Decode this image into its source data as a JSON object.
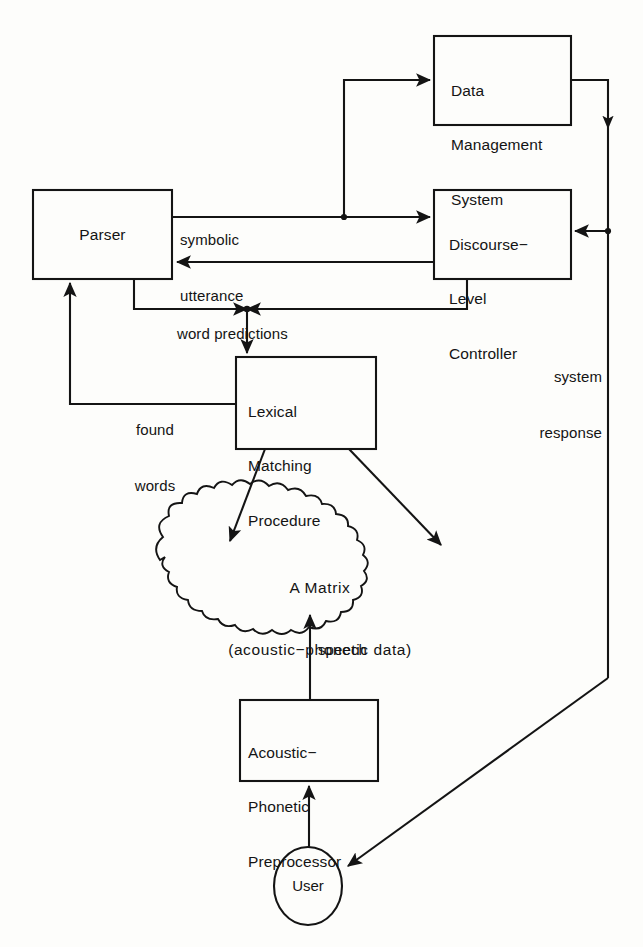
{
  "diagram": {
    "background_color": "#fdfdfb",
    "stroke_color": "#141414",
    "text_color": "#141414",
    "nodes": {
      "data_management_system": {
        "shape": "rectangle",
        "lines": [
          "Data",
          "Management",
          "System"
        ],
        "line1": "Data",
        "line2": "Management",
        "line3": "System"
      },
      "parser": {
        "shape": "rectangle",
        "label": "Parser"
      },
      "discourse_level_controller": {
        "shape": "rectangle",
        "lines": [
          "Discourse−",
          "Level",
          "Controller"
        ],
        "line1": "Discourse−",
        "line2": "Level",
        "line3": "Controller"
      },
      "lexical_matching_procedure": {
        "shape": "rectangle",
        "lines": [
          "Lexical",
          "Matching",
          "Procedure"
        ],
        "line1": "Lexical",
        "line2": "Matching",
        "line3": "Procedure"
      },
      "a_matrix": {
        "shape": "cloud",
        "line1": "A Matrix",
        "line2": "(acoustic−phonetic data)"
      },
      "acoustic_phonetic_preprocessor": {
        "shape": "rectangle",
        "lines": [
          "Acoustic−",
          "Phonetic",
          "Preprocessor"
        ],
        "line1": "Acoustic−",
        "line2": "Phonetic",
        "line3": "Preprocessor"
      },
      "user": {
        "shape": "ellipse",
        "label": "User"
      }
    },
    "edge_labels": {
      "symbolic_utterance_line1": "symbolic",
      "symbolic_utterance_line2": "utterance",
      "word_predictions": "word predictions",
      "found_words_line1": "found",
      "found_words_line2": "words",
      "system_response_line1": "system",
      "system_response_line2": "response",
      "speech": "speech"
    },
    "edges": [
      {
        "from": "parser",
        "to": "discourse_level_controller",
        "label": "symbolic utterance"
      },
      {
        "from": "parser",
        "to": "data_management_system",
        "label": "symbolic utterance"
      },
      {
        "from": "data_management_system",
        "to": "discourse_level_controller",
        "label": ""
      },
      {
        "from": "discourse_level_controller",
        "to": "parser",
        "label": ""
      },
      {
        "from": "parser",
        "to": "lexical_matching_procedure",
        "label": "word predictions"
      },
      {
        "from": "discourse_level_controller",
        "to": "lexical_matching_procedure",
        "label": "word predictions"
      },
      {
        "from": "lexical_matching_procedure",
        "to": "parser",
        "label": "found words"
      },
      {
        "from": "lexical_matching_procedure",
        "to": "a_matrix",
        "label": ""
      },
      {
        "from": "acoustic_phonetic_preprocessor",
        "to": "a_matrix",
        "label": "speech"
      },
      {
        "from": "user",
        "to": "acoustic_phonetic_preprocessor",
        "label": ""
      },
      {
        "from": "data_management_system",
        "to": "user",
        "label": "system response"
      }
    ]
  }
}
